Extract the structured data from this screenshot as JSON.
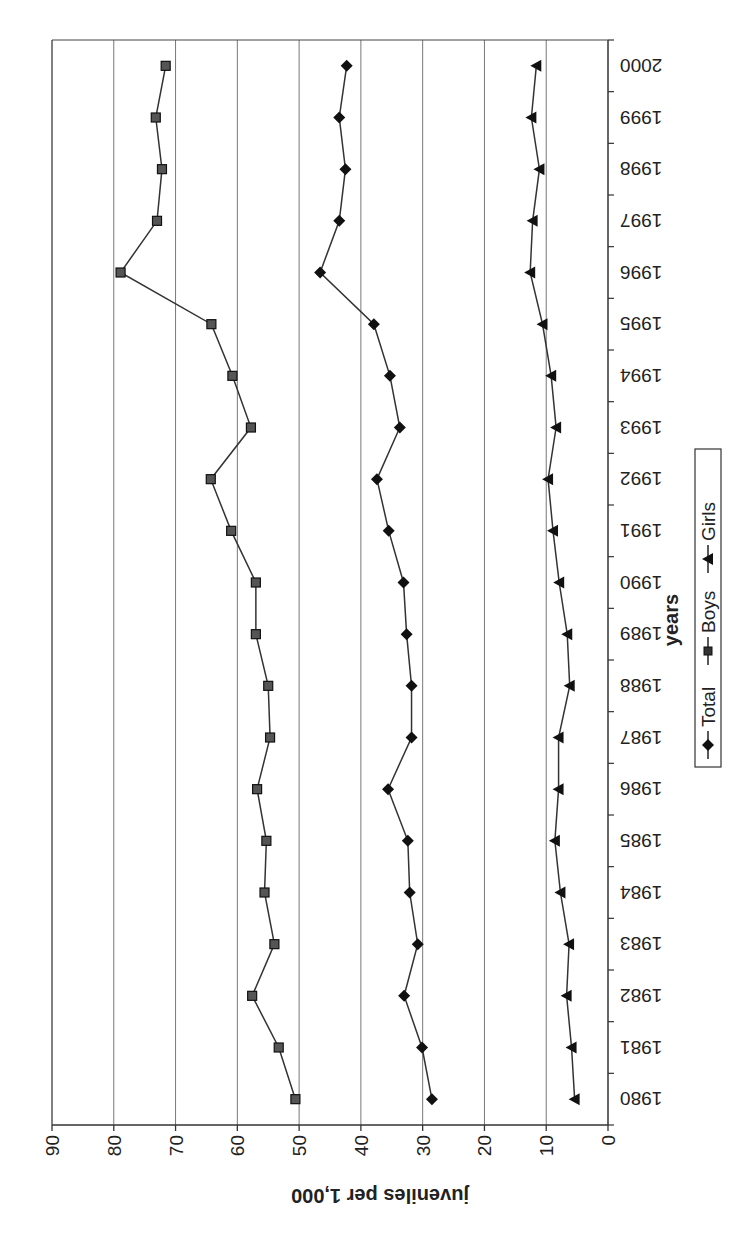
{
  "chart_data": {
    "type": "line",
    "orientation_note": "figure rotated 90 degrees counter-clockwise on page",
    "title": "",
    "xlabel": "years",
    "ylabel": "juveniles per 1,000",
    "ylim": [
      0,
      90
    ],
    "yticks": [
      0,
      10,
      20,
      30,
      40,
      50,
      60,
      70,
      80,
      90
    ],
    "grid": "horizontal major gridlines",
    "legend_position": "bottom",
    "x": [
      "1980",
      "1981",
      "1982",
      "1983",
      "1984",
      "1985",
      "1986",
      "1987",
      "1988",
      "1989",
      "1990",
      "1991",
      "1992",
      "1993",
      "1994",
      "1995",
      "1996",
      "1997",
      "1998",
      "1999",
      "2000"
    ],
    "series": [
      {
        "name": "Total",
        "marker": "diamond",
        "values": [
          28.5,
          30.1,
          33.0,
          30.8,
          32.1,
          32.4,
          35.6,
          31.8,
          31.8,
          32.6,
          33.1,
          35.5,
          37.4,
          33.7,
          35.3,
          37.9,
          46.6,
          43.5,
          42.5,
          43.5,
          42.3
        ]
      },
      {
        "name": "Boys",
        "marker": "square",
        "values": [
          50.6,
          53.3,
          57.6,
          54.0,
          55.6,
          55.3,
          56.8,
          54.7,
          55.0,
          57.0,
          57.0,
          61.0,
          64.3,
          57.8,
          60.8,
          64.2,
          78.9,
          73.0,
          72.2,
          73.2,
          71.6
        ]
      },
      {
        "name": "Girls",
        "marker": "triangle",
        "values": [
          5.4,
          5.9,
          6.7,
          6.3,
          7.7,
          8.6,
          8.0,
          8.0,
          6.2,
          6.6,
          7.9,
          8.9,
          9.7,
          8.4,
          9.2,
          10.6,
          12.6,
          12.2,
          11.1,
          12.4,
          11.6
        ]
      }
    ]
  },
  "axes": {
    "x_title": "years",
    "y_title": "juveniles per 1,000"
  },
  "legend": {
    "items": [
      {
        "label": "Total"
      },
      {
        "label": "Boys"
      },
      {
        "label": "Girls"
      }
    ]
  }
}
